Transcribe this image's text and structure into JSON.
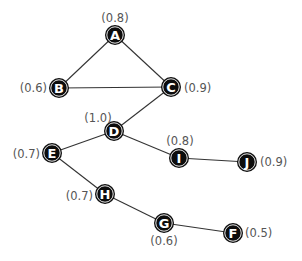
{
  "diagram": {
    "type": "graph",
    "nodes": [
      {
        "id": "A",
        "x": 115,
        "y": 35,
        "value": "(0.8)",
        "label_x": 115,
        "label_y": 18,
        "anchor": "middle"
      },
      {
        "id": "B",
        "x": 59,
        "y": 88,
        "value": "(0.6)",
        "label_x": 47,
        "label_y": 88,
        "anchor": "end"
      },
      {
        "id": "C",
        "x": 171,
        "y": 87,
        "value": "(0.9)",
        "label_x": 184,
        "label_y": 88,
        "anchor": "start"
      },
      {
        "id": "D",
        "x": 114,
        "y": 131,
        "value": "(1.0)",
        "label_x": 98,
        "label_y": 118,
        "anchor": "middle"
      },
      {
        "id": "E",
        "x": 52,
        "y": 153,
        "value": "(0.7)",
        "label_x": 40,
        "label_y": 154,
        "anchor": "end"
      },
      {
        "id": "I",
        "x": 179,
        "y": 158,
        "value": "(0.8)",
        "label_x": 180,
        "label_y": 141,
        "anchor": "middle"
      },
      {
        "id": "J",
        "x": 247,
        "y": 162,
        "value": "(0.9)",
        "label_x": 260,
        "label_y": 162,
        "anchor": "start"
      },
      {
        "id": "H",
        "x": 105,
        "y": 194,
        "value": "(0.7)",
        "label_x": 93,
        "label_y": 196,
        "anchor": "end"
      },
      {
        "id": "G",
        "x": 164,
        "y": 223,
        "value": "(0.6)",
        "label_x": 164,
        "label_y": 241,
        "anchor": "middle"
      },
      {
        "id": "F",
        "x": 233,
        "y": 233,
        "value": "(0.5)",
        "label_x": 245,
        "label_y": 233,
        "anchor": "start"
      }
    ],
    "edges": [
      [
        "A",
        "B"
      ],
      [
        "A",
        "C"
      ],
      [
        "B",
        "C"
      ],
      [
        "C",
        "D"
      ],
      [
        "D",
        "E"
      ],
      [
        "D",
        "I"
      ],
      [
        "I",
        "J"
      ],
      [
        "E",
        "H"
      ],
      [
        "H",
        "G"
      ],
      [
        "G",
        "F"
      ]
    ],
    "colors": {
      "node_fill": "#0d0d0d",
      "node_text": "#ffffff",
      "edge": "#333333",
      "value_text": "#555555"
    }
  }
}
